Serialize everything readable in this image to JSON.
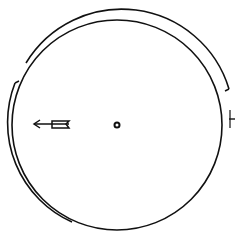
{
  "diagram": {
    "type": "line-drawing",
    "background": "#ffffff",
    "stroke_color": "#111111",
    "main_circle": {
      "cx": 117,
      "cy": 125,
      "r": 105
    },
    "outer_arc_top": {
      "from": [
        26,
        63
      ],
      "to": [
        229,
        89
      ],
      "label": ""
    },
    "outer_arc_left": {
      "from": [
        15,
        83
      ],
      "to": [
        72,
        222
      ],
      "label": ""
    },
    "right_notch": {
      "x1": 229,
      "y1": 120,
      "x2": 235,
      "y2": 120
    },
    "center_dot": {
      "cx": 117,
      "cy": 125,
      "r": 2.5
    },
    "arrow": {
      "from": [
        69,
        124
      ],
      "to": [
        33,
        124
      ],
      "direction": "left"
    }
  }
}
